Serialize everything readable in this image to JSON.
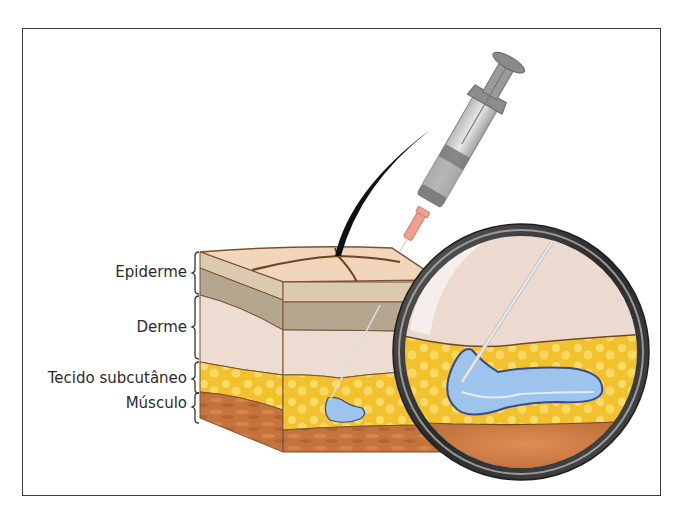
{
  "figure": {
    "type": "illustration",
    "layers": [
      {
        "key": "epidermis",
        "label": "Epiderme"
      },
      {
        "key": "dermis",
        "label": "Derme"
      },
      {
        "key": "subcutaneous",
        "label": "Tecido subcutâneo"
      },
      {
        "key": "muscle",
        "label": "Músculo"
      }
    ],
    "colors": {
      "frame": "#3a3a3a",
      "skin_top": "#f1d6bc",
      "epidermis_light": "#dccab0",
      "epidermis_dark": "#b5a78f",
      "dermis": "#eddcd2",
      "fat": "#f2c22e",
      "fat_highlight": "#fbe27a",
      "muscle": "#c9773e",
      "muscle_dark": "#a85a2a",
      "outline": "#7a5230",
      "fluid": "#9cc4ec",
      "fluid_outline": "#3d4a8a",
      "syringe_gray": "#9a9a9a",
      "needle_hub": "#f0a090",
      "hair": "#111111",
      "lens_ring": "#3c3c3c"
    }
  }
}
